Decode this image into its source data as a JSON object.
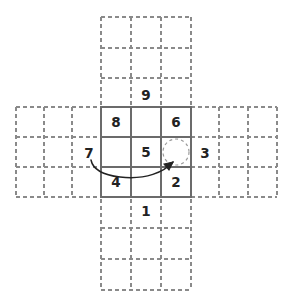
{
  "diagram": {
    "background_color": "#ffffff",
    "solid_line_color": "#6b6b6b",
    "dashed_line_color": "#8a8a8a",
    "text_color": "#222222",
    "arrow_color": "#222222",
    "cell_size": 30,
    "solid_board": {
      "name": "center-3x3-board",
      "left": 101,
      "top": 107,
      "width": 90,
      "height": 90
    },
    "dashed_bands": {
      "horizontal": {
        "left": 16,
        "top": 107,
        "right": 277,
        "bottom": 197
      },
      "vertical": {
        "left": 101,
        "top": 17,
        "right": 191,
        "bottom": 290
      }
    },
    "dashed_grid_lines": {
      "vertical_x": [
        16,
        44,
        72,
        101,
        131,
        161,
        191,
        219,
        248,
        277
      ],
      "horizontal_y": [
        17,
        48,
        78,
        107,
        137,
        167,
        197,
        228,
        259,
        290
      ]
    },
    "tiles": [
      {
        "label": "8",
        "cx": 116,
        "cy": 122,
        "cell": "top-left"
      },
      {
        "label": "6",
        "cx": 176,
        "cy": 122,
        "cell": "top-right"
      },
      {
        "label": "5",
        "cx": 146,
        "cy": 152,
        "cell": "center"
      },
      {
        "label": "4",
        "cx": 116,
        "cy": 182,
        "cell": "bottom-left"
      },
      {
        "label": "2",
        "cx": 176,
        "cy": 182,
        "cell": "bottom-right"
      }
    ],
    "empty_slot": {
      "name": "empty-slot",
      "cx": 176,
      "cy": 152,
      "radius": 13,
      "cell": "center-right",
      "style": "dashed-circle"
    },
    "outside_labels": [
      {
        "label": "9",
        "cx": 146,
        "cy": 95,
        "position": "above"
      },
      {
        "label": "7",
        "cx": 89,
        "cy": 153,
        "position": "left"
      },
      {
        "label": "3",
        "cx": 205,
        "cy": 153,
        "position": "right"
      },
      {
        "label": "1",
        "cx": 146,
        "cy": 211,
        "position": "below"
      }
    ],
    "move_arrow": {
      "name": "move-arrow",
      "from_label": "7",
      "to_label": "empty-slot",
      "path": "M 91,160 C 93,170 103,175 120,177 C 145,179 163,172 172,163",
      "head_at": {
        "x": 172,
        "y": 163
      }
    }
  }
}
